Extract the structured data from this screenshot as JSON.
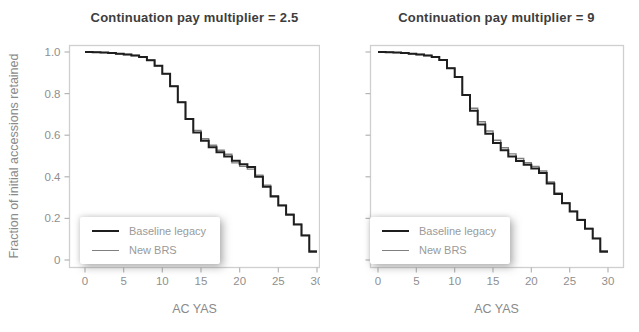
{
  "colors": {
    "background": "#ffffff",
    "panel_border": "#cfcfcf",
    "tick": "#b5b5b5",
    "tick_label": "#8f8f8f",
    "axis_label": "#8a8a8a",
    "title": "#3d3d3d",
    "legend_text": "#9a9a9a",
    "baseline_line": "#1e1e1e",
    "brs_line": "#808080"
  },
  "legend": {
    "items": [
      {
        "label": "Baseline legacy",
        "color": "#1e1e1e",
        "line_weight": 2.0
      },
      {
        "label": "New BRS",
        "color": "#808080",
        "line_weight": 1.4
      }
    ],
    "position": "bottom-left inside panel"
  },
  "chart_data": [
    {
      "type": "line",
      "subtype": "step",
      "title": "Continuation pay multiplier = 2.5",
      "xlabel": "AC YAS",
      "ylabel": "Fraction of initial accessions retained",
      "xlim": [
        0,
        30
      ],
      "ylim": [
        0,
        1.0
      ],
      "grid": false,
      "x_ticks": [
        0,
        5,
        10,
        15,
        20,
        25,
        30
      ],
      "x_tick_labels": [
        "0",
        "5",
        "10",
        "15",
        "20",
        "25",
        "30"
      ],
      "y_ticks": [
        0,
        0.2,
        0.4,
        0.6,
        0.8,
        1.0
      ],
      "y_tick_labels": [
        "0",
        "0.2",
        "0.4",
        "0.6",
        "0.8",
        "1.0"
      ],
      "show_y_tick_labels": true,
      "x": [
        0,
        1,
        2,
        3,
        4,
        5,
        6,
        7,
        8,
        9,
        10,
        11,
        12,
        13,
        14,
        15,
        16,
        17,
        18,
        19,
        20,
        21,
        22,
        23,
        24,
        25,
        26,
        27,
        28,
        29,
        30
      ],
      "series": [
        {
          "name": "Baseline legacy",
          "values": [
            1.0,
            0.999,
            0.997,
            0.995,
            0.992,
            0.988,
            0.983,
            0.976,
            0.96,
            0.934,
            0.895,
            0.835,
            0.758,
            0.678,
            0.613,
            0.573,
            0.542,
            0.518,
            0.498,
            0.477,
            0.46,
            0.447,
            0.4,
            0.352,
            0.305,
            0.262,
            0.218,
            0.17,
            0.118,
            0.04,
            0.04
          ]
        },
        {
          "name": "New BRS",
          "values": [
            1.0,
            0.999,
            0.997,
            0.995,
            0.992,
            0.988,
            0.983,
            0.976,
            0.96,
            0.934,
            0.895,
            0.835,
            0.758,
            0.678,
            0.623,
            0.583,
            0.552,
            0.528,
            0.508,
            0.467,
            0.45,
            0.437,
            0.408,
            0.36,
            0.309,
            0.264,
            0.22,
            0.172,
            0.119,
            0.044,
            0.044
          ]
        }
      ]
    },
    {
      "type": "line",
      "subtype": "step",
      "title": "Continuation pay multiplier = 9",
      "xlabel": "AC YAS",
      "ylabel": "Fraction of initial accessions retained",
      "xlim": [
        0,
        30
      ],
      "ylim": [
        0,
        1.0
      ],
      "grid": false,
      "x_ticks": [
        0,
        5,
        10,
        15,
        20,
        25,
        30
      ],
      "x_tick_labels": [
        "0",
        "5",
        "10",
        "15",
        "20",
        "25",
        "30"
      ],
      "y_ticks": [
        0,
        0.2,
        0.4,
        0.6,
        0.8,
        1.0
      ],
      "y_tick_labels": [
        "0",
        "0.2",
        "0.4",
        "0.6",
        "0.8",
        "1.0"
      ],
      "show_y_tick_labels": false,
      "x": [
        0,
        1,
        2,
        3,
        4,
        5,
        6,
        7,
        8,
        9,
        10,
        11,
        12,
        13,
        14,
        15,
        16,
        17,
        18,
        19,
        20,
        21,
        22,
        23,
        24,
        25,
        26,
        27,
        28,
        29,
        30
      ],
      "series": [
        {
          "name": "Baseline legacy",
          "values": [
            1.0,
            0.999,
            0.997,
            0.995,
            0.992,
            0.988,
            0.983,
            0.976,
            0.961,
            0.922,
            0.88,
            0.793,
            0.718,
            0.652,
            0.607,
            0.563,
            0.528,
            0.498,
            0.476,
            0.458,
            0.44,
            0.418,
            0.368,
            0.318,
            0.273,
            0.233,
            0.193,
            0.15,
            0.103,
            0.04,
            0.04
          ]
        },
        {
          "name": "New BRS",
          "values": [
            1.0,
            0.999,
            0.997,
            0.995,
            0.992,
            0.988,
            0.983,
            0.976,
            0.961,
            0.922,
            0.88,
            0.793,
            0.73,
            0.665,
            0.62,
            0.576,
            0.54,
            0.51,
            0.488,
            0.468,
            0.45,
            0.428,
            0.375,
            0.322,
            0.276,
            0.235,
            0.195,
            0.152,
            0.104,
            0.044,
            0.044
          ]
        }
      ]
    }
  ]
}
